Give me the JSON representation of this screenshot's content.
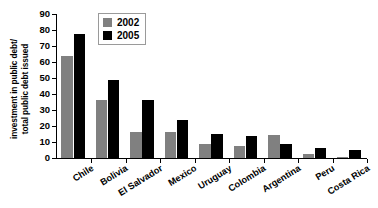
{
  "chart_data": {
    "type": "bar",
    "title": "",
    "subtitle": "",
    "xlabel": "",
    "ylabel_line1": "investment in public debt/",
    "ylabel_line2": "total public debt issued",
    "categories": [
      "Chile",
      "Bolivia",
      "El Salvador",
      "Mexico",
      "Uruguay",
      "Colombia",
      "Argentina",
      "Peru",
      "Costa Rica"
    ],
    "series": [
      {
        "name": "2002",
        "color": "#808080",
        "values": [
          63.5,
          36.0,
          16.0,
          16.5,
          9.0,
          7.5,
          14.5,
          2.5,
          0.7
        ]
      },
      {
        "name": "2005",
        "color": "#000000",
        "values": [
          77.5,
          48.5,
          36.0,
          23.5,
          15.0,
          13.5,
          8.5,
          6.0,
          5.3
        ]
      }
    ],
    "ylim": [
      0,
      90
    ],
    "yticks": [
      0,
      10,
      20,
      30,
      40,
      50,
      60,
      70,
      80,
      90
    ],
    "ytick_labels": [
      "0",
      "10",
      "20",
      "30",
      "40",
      "50",
      "60",
      "70",
      "80",
      "90"
    ],
    "grid": false,
    "legend_position": "upper-center",
    "legend_entries": [
      "2002",
      "2005"
    ]
  }
}
